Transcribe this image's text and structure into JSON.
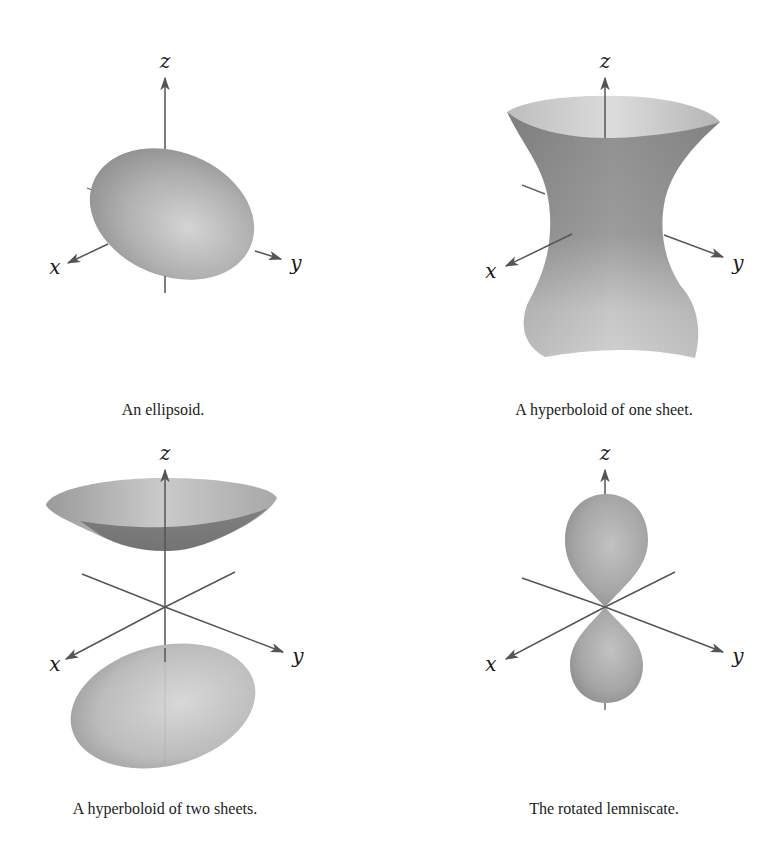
{
  "figures": [
    {
      "id": "ellipsoid",
      "caption": "An ellipsoid.",
      "axes": {
        "x": "x",
        "y": "y",
        "z": "z"
      }
    },
    {
      "id": "hyperboloid-one-sheet",
      "caption": "A hyperboloid of one sheet.",
      "axes": {
        "x": "x",
        "y": "y",
        "z": "z"
      }
    },
    {
      "id": "hyperboloid-two-sheets",
      "caption": "A hyperboloid of two sheets.",
      "axes": {
        "x": "x",
        "y": "y",
        "z": "z"
      }
    },
    {
      "id": "rotated-lemniscate",
      "caption": "The rotated lemniscate.",
      "axes": {
        "x": "x",
        "y": "y",
        "z": "z"
      }
    }
  ],
  "colors": {
    "surface_light": "#d2d2d2",
    "surface_mid": "#a8a8a8",
    "surface_dark": "#7e7e7e",
    "axis": "#555555",
    "background": "#ffffff"
  }
}
